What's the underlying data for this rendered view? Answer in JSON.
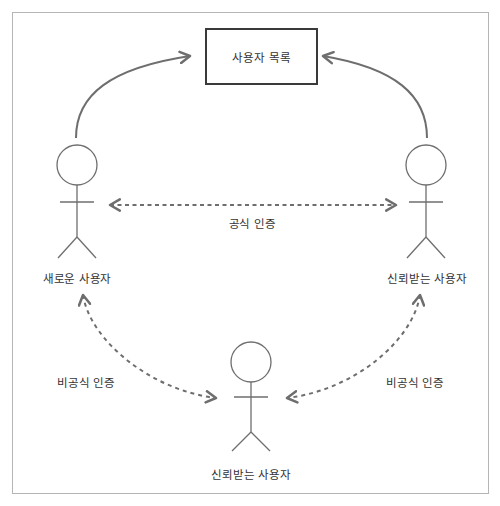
{
  "diagram": {
    "user_list_box": {
      "label": "사용자 목록"
    },
    "actors": {
      "new_user": {
        "label": "새로운 사용자"
      },
      "trusted_user_right": {
        "label": "신뢰받는 사용자"
      },
      "trusted_user_bottom": {
        "label": "신뢰받는 사용자"
      }
    },
    "edges": {
      "formal_auth": {
        "label": "공식 인증",
        "style": "dashed",
        "direction": "both"
      },
      "informal_auth_left": {
        "label": "비공식 인증",
        "style": "dashed",
        "direction": "both"
      },
      "informal_auth_right": {
        "label": "비공식 인증",
        "style": "dashed",
        "direction": "both"
      },
      "new_user_to_list": {
        "style": "solid",
        "direction": "to-list"
      },
      "trusted_to_list": {
        "style": "solid",
        "direction": "to-list"
      }
    },
    "colors": {
      "line": "#6e6e6e",
      "text": "#333333",
      "frame": "#b5b5b5"
    }
  }
}
